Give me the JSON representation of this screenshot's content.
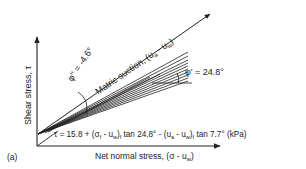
{
  "figure": {
    "panel_label": "(a)",
    "y_axis_label": "Shear stress, τ",
    "x_axis_label": "Net normal stress, (σ - u",
    "x_axis_label_sub": "w",
    "x_axis_label_end": ")",
    "suction_axis_label": "Matric suction, (u",
    "suction_axis_sub_a": "a",
    "suction_axis_mid": " - u",
    "suction_axis_sub_w": "w",
    "suction_axis_end": ")",
    "phi_prime_label": "φ' = 24.8°",
    "phi_b_label": "φ'' = -4.6°",
    "equation": {
      "part1": "τ = 15.8 + (σ",
      "sub_f": "f",
      "part2": " - u",
      "sub_w1": "w",
      "part3": ")",
      "sub_f2": "f",
      "part4": " tan 24.8° - (u",
      "sub_a": "a",
      "part5": " - u",
      "sub_w2": "w",
      "part6": ")",
      "sub_f3": "f",
      "part7": " tan 7.7° (kPa)"
    },
    "colors": {
      "line": "#222222",
      "text": "#222222",
      "background": "#ffffff"
    }
  }
}
